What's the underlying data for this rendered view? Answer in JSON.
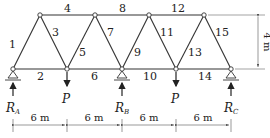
{
  "diagram": {
    "type": "truss",
    "member_labels": [
      "1",
      "2",
      "3",
      "4",
      "5",
      "6",
      "7",
      "8",
      "9",
      "10",
      "11",
      "12",
      "13",
      "14",
      "15"
    ],
    "loads": [
      {
        "label": "P"
      },
      {
        "label": "P"
      }
    ],
    "reactions": [
      {
        "main": "R",
        "sub": "A"
      },
      {
        "main": "R",
        "sub": "B"
      },
      {
        "main": "R",
        "sub": "C"
      }
    ],
    "spans": [
      "6 m",
      "6 m",
      "6 m",
      "6 m"
    ],
    "height": "4 m"
  }
}
